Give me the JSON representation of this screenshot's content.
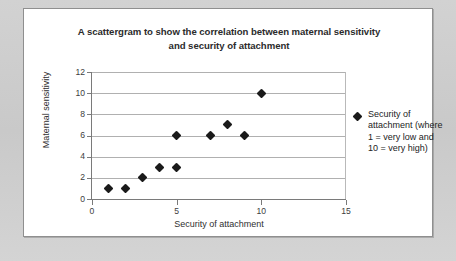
{
  "chart_data": {
    "type": "scatter",
    "title": "A scattergram to show the correlation between maternal sensitivity and security of attachment",
    "title_line1": "A scattergram to show the correlation between maternal sensitivity",
    "title_line2": "and security of attachment",
    "xlabel": "Security of attachment",
    "ylabel": "Maternal sensitivity",
    "xlim": [
      0,
      15
    ],
    "ylim": [
      0,
      12
    ],
    "xticks": [
      0,
      5,
      10,
      15
    ],
    "yticks": [
      0,
      2,
      4,
      6,
      8,
      10,
      12
    ],
    "xtick_labels": [
      "0",
      "5",
      "10",
      "15"
    ],
    "ytick_labels": [
      "0",
      "2",
      "4",
      "6",
      "8",
      "10",
      "12"
    ],
    "grid": "horizontal",
    "legend_position": "right",
    "marker": "diamond",
    "marker_color": "#1a1a1a",
    "series": [
      {
        "name": "Security of attachment (where 1 = very low and 10 = very high)",
        "points": [
          {
            "x": 1,
            "y": 1
          },
          {
            "x": 2,
            "y": 1
          },
          {
            "x": 3,
            "y": 2
          },
          {
            "x": 4,
            "y": 3
          },
          {
            "x": 5,
            "y": 3
          },
          {
            "x": 5,
            "y": 6
          },
          {
            "x": 7,
            "y": 6
          },
          {
            "x": 8,
            "y": 7
          },
          {
            "x": 9,
            "y": 6
          },
          {
            "x": 10,
            "y": 10
          }
        ]
      }
    ]
  },
  "legend": {
    "label": "Security of attachment (where 1 = very low and 10 = very high)"
  },
  "colors": {
    "marker": "#1a1a1a",
    "gridline": "#b0b0b0",
    "axis": "#7a7a7a",
    "outer_background": "#cfcfcf",
    "card_background": "#ffffff",
    "title_text": "#2b2b2b"
  }
}
